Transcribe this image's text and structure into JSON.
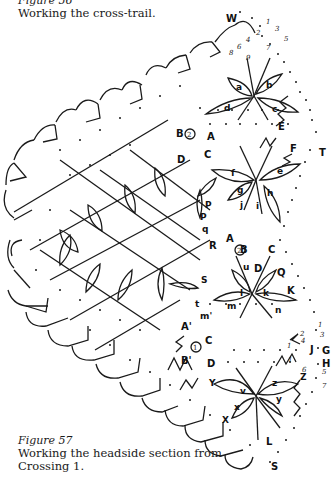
{
  "captions": {
    "figure56": {
      "label": "Figure 56",
      "text": "Working the cross-trail."
    },
    "figure57": {
      "label": "Figure 57",
      "text_line1": "Working the headside section from",
      "text_line2": "Crossing 1."
    }
  },
  "diagram": {
    "pin_labels": [
      "W",
      "A",
      "B",
      "C",
      "D",
      "E",
      "F",
      "T",
      "P",
      "R",
      "S",
      "Q",
      "K",
      "L",
      "G",
      "H",
      "J",
      "Z",
      "X",
      "Y"
    ],
    "leaf_labels": [
      "a",
      "b",
      "c",
      "d",
      "e",
      "f",
      "g",
      "h",
      "i",
      "j",
      "k",
      "l",
      "m",
      "n",
      "p",
      "q",
      "r",
      "s",
      "t",
      "u",
      "v",
      "x",
      "y",
      "z"
    ],
    "crossing_markers": [
      "1",
      "2"
    ],
    "top_numbers": [
      "1",
      "2",
      "3",
      "4",
      "5",
      "6",
      "7",
      "8",
      "9"
    ],
    "right_numbers": [
      "1",
      "2",
      "3",
      "4",
      "5",
      "7"
    ]
  }
}
